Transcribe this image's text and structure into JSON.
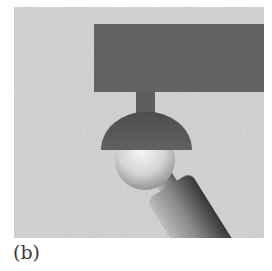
{
  "figure": {
    "panel_label": "(b)",
    "colors": {
      "background": "#d6d6d6",
      "base_block": "#666666",
      "socket_cap": "#585858",
      "ball_highlight": "#f2f2f2",
      "ball_shadow": "#8a8a8a",
      "link_light": "#bdbdbd",
      "link_dark": "#3c3c3c"
    }
  }
}
